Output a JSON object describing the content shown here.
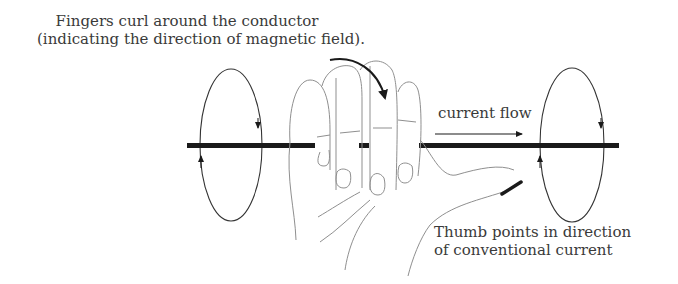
{
  "captions": {
    "fingers_line1": "Fingers curl around the conductor",
    "fingers_line2": "(indicating the direction of magnetic field).",
    "thumb_line1": "Thumb points in direction",
    "thumb_line2": "of conventional current",
    "current_flow": "current flow"
  },
  "elements": {
    "conductor": "straight current-carrying wire",
    "left_field_loop": "magnetic field loop (left)",
    "right_field_loop": "magnetic field loop (right)",
    "hand": "right hand gripping wire"
  },
  "colors": {
    "ink": "#1a1a1a",
    "text": "#3a3a3a",
    "hand_outline": "#9a9a9a"
  }
}
